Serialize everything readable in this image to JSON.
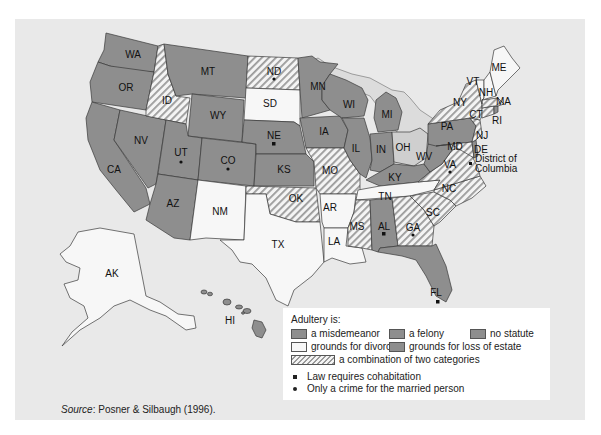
{
  "legend": {
    "title": "Adultery is:",
    "categories": [
      {
        "key": "misdemeanor",
        "label": "a misdemeanor",
        "fill": "#8e8e8e"
      },
      {
        "key": "felony",
        "label": "a felony",
        "fill": "#8e8e8e"
      },
      {
        "key": "no_statute",
        "label": "no statute",
        "fill": "#8e8e8e"
      },
      {
        "key": "divorce",
        "label": "grounds for divorce",
        "fill": "#f7f7f7"
      },
      {
        "key": "loss_estate",
        "label": "grounds for loss of estate",
        "fill": "#8e8e8e"
      },
      {
        "key": "combination",
        "label": "a combination of two categories",
        "fill": "hatched"
      }
    ],
    "markers": [
      {
        "symbol": "square",
        "label": "Law requires cohabitation"
      },
      {
        "symbol": "dot",
        "label": "Only a crime for the married person"
      }
    ]
  },
  "source": {
    "prefix": "Source",
    "text": ": Posner & Silbaugh (1996)."
  },
  "annotations": {
    "dc_line1": "District of",
    "dc_line2": "Columbia"
  },
  "colors": {
    "background": "#e9e9e9",
    "gray": "#8e8e8e",
    "light": "#f7f7f7",
    "ohio": "#cfcfcf",
    "outline": "#3a3a3a"
  },
  "states": [
    {
      "abbr": "WA",
      "fill": "gray"
    },
    {
      "abbr": "OR",
      "fill": "gray"
    },
    {
      "abbr": "CA",
      "fill": "gray"
    },
    {
      "abbr": "NV",
      "fill": "gray"
    },
    {
      "abbr": "ID",
      "fill": "hatch"
    },
    {
      "abbr": "MT",
      "fill": "gray"
    },
    {
      "abbr": "WY",
      "fill": "gray"
    },
    {
      "abbr": "UT",
      "fill": "gray",
      "marker": "dot"
    },
    {
      "abbr": "CO",
      "fill": "gray",
      "marker": "dot"
    },
    {
      "abbr": "AZ",
      "fill": "gray"
    },
    {
      "abbr": "NM",
      "fill": "light"
    },
    {
      "abbr": "ND",
      "fill": "hatch",
      "marker": "dot"
    },
    {
      "abbr": "SD",
      "fill": "light"
    },
    {
      "abbr": "NE",
      "fill": "gray",
      "marker": "square"
    },
    {
      "abbr": "KS",
      "fill": "gray"
    },
    {
      "abbr": "OK",
      "fill": "hatch"
    },
    {
      "abbr": "TX",
      "fill": "light"
    },
    {
      "abbr": "MN",
      "fill": "gray"
    },
    {
      "abbr": "IA",
      "fill": "gray"
    },
    {
      "abbr": "MO",
      "fill": "hatch"
    },
    {
      "abbr": "AR",
      "fill": "light"
    },
    {
      "abbr": "LA",
      "fill": "light"
    },
    {
      "abbr": "WI",
      "fill": "gray"
    },
    {
      "abbr": "IL",
      "fill": "gray"
    },
    {
      "abbr": "MI",
      "fill": "gray"
    },
    {
      "abbr": "IN",
      "fill": "gray"
    },
    {
      "abbr": "OH",
      "fill": "ohio"
    },
    {
      "abbr": "KY",
      "fill": "gray"
    },
    {
      "abbr": "TN",
      "fill": "light"
    },
    {
      "abbr": "MS",
      "fill": "hatch"
    },
    {
      "abbr": "AL",
      "fill": "gray",
      "marker": "square"
    },
    {
      "abbr": "GA",
      "fill": "hatch",
      "marker": "dot"
    },
    {
      "abbr": "FL",
      "fill": "gray",
      "marker": "square"
    },
    {
      "abbr": "SC",
      "fill": "hatch"
    },
    {
      "abbr": "NC",
      "fill": "hatch"
    },
    {
      "abbr": "VA",
      "fill": "hatch",
      "marker": "dot"
    },
    {
      "abbr": "WV",
      "fill": "gray"
    },
    {
      "abbr": "PA",
      "fill": "gray"
    },
    {
      "abbr": "MD",
      "fill": "hatch"
    },
    {
      "abbr": "DE",
      "fill": "gray"
    },
    {
      "abbr": "NJ",
      "fill": "hatch"
    },
    {
      "abbr": "NY",
      "fill": "hatch"
    },
    {
      "abbr": "CT",
      "fill": "hatch"
    },
    {
      "abbr": "RI",
      "fill": "gray"
    },
    {
      "abbr": "MA",
      "fill": "hatch"
    },
    {
      "abbr": "VT",
      "fill": "light"
    },
    {
      "abbr": "NH",
      "fill": "light"
    },
    {
      "abbr": "ME",
      "fill": "light"
    },
    {
      "abbr": "AK",
      "fill": "light"
    },
    {
      "abbr": "HI",
      "fill": "gray"
    }
  ]
}
